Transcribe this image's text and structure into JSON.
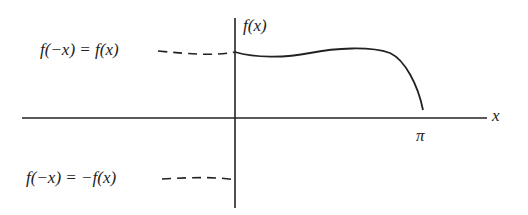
{
  "diagram": {
    "axis_labels": {
      "y": "f(x)",
      "x": "x",
      "pi": "π"
    },
    "annotations": {
      "even_extension": "f(−x) = f(x)",
      "odd_extension": "f(−x) = −f(x)"
    },
    "colors": {
      "stroke": "#222222",
      "background": "#ffffff"
    }
  }
}
